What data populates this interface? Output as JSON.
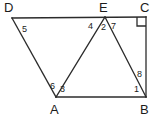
{
  "figure": {
    "stroke_color": "#2b2b2b",
    "label_color": "#1b1b1b",
    "background_color": "#ffffff",
    "stroke_width": 1.3,
    "vertices": [
      {
        "name": "D",
        "label": "D",
        "x": 12,
        "y": 18,
        "label_x": 4,
        "label_y": 1
      },
      {
        "name": "E",
        "label": "E",
        "x": 105,
        "y": 17,
        "label_x": 99,
        "label_y": 1
      },
      {
        "name": "C",
        "label": "C",
        "x": 146,
        "y": 17,
        "label_x": 140,
        "label_y": 1
      },
      {
        "name": "A",
        "label": "A",
        "x": 56,
        "y": 97,
        "label_x": 50,
        "label_y": 103
      },
      {
        "name": "B",
        "label": "B",
        "x": 146,
        "y": 97,
        "label_x": 140,
        "label_y": 103
      }
    ],
    "segments": [
      {
        "name": "segment-DC",
        "from": "D",
        "to": "C"
      },
      {
        "name": "segment-DA",
        "from": "D",
        "to": "A"
      },
      {
        "name": "segment-AB",
        "from": "A",
        "to": "B"
      },
      {
        "name": "segment-CB",
        "from": "C",
        "to": "B"
      },
      {
        "name": "segment-AE",
        "from": "A",
        "to": "E"
      },
      {
        "name": "segment-EB",
        "from": "E",
        "to": "B"
      }
    ],
    "angle_labels": [
      {
        "name": "angle-1",
        "text": "1",
        "x": 134,
        "y": 85,
        "at_vertex": "B"
      },
      {
        "name": "angle-2",
        "text": "2",
        "x": 101,
        "y": 23,
        "at_vertex": "E"
      },
      {
        "name": "angle-3",
        "text": "3",
        "x": 60,
        "y": 85,
        "at_vertex": "A"
      },
      {
        "name": "angle-4",
        "text": "4",
        "x": 88,
        "y": 22,
        "at_vertex": "E"
      },
      {
        "name": "angle-5",
        "text": "5",
        "x": 22,
        "y": 25,
        "at_vertex": "D"
      },
      {
        "name": "angle-6",
        "text": "6",
        "x": 50,
        "y": 82,
        "at_vertex": "A"
      },
      {
        "name": "angle-7",
        "text": "7",
        "x": 111,
        "y": 22,
        "at_vertex": "E"
      },
      {
        "name": "angle-8",
        "text": "8",
        "x": 137,
        "y": 70,
        "at_vertex": "B"
      }
    ],
    "right_angle_marker": {
      "name": "right-angle-marker-C",
      "at_vertex": "C",
      "size": 9
    }
  }
}
